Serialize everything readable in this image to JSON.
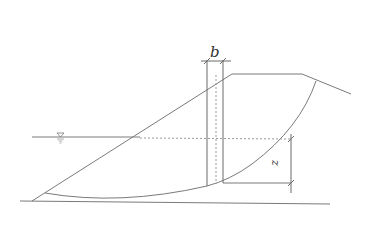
{
  "diagram": {
    "title": "",
    "type": "slope stability slice diagram",
    "labels": {
      "slice_width": "b",
      "depth_below_water": "z"
    },
    "symbols": {
      "water_level": "water-level-triangle-icon"
    },
    "colors": {
      "line": "#7a7a7a",
      "text": "#333333",
      "background": "#ffffff"
    }
  }
}
